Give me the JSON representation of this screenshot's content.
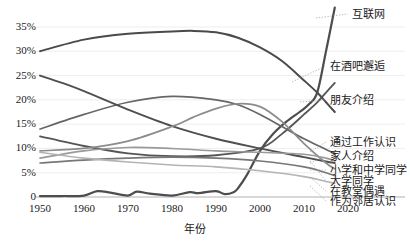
{
  "chart_data": {
    "type": "line",
    "title": "",
    "xlabel": "年份",
    "ylabel": "",
    "xlim": [
      1950,
      2020
    ],
    "ylim": [
      0,
      0.37
    ],
    "grid": true,
    "legend_position": "right-inline",
    "x_ticks": [
      "1950",
      "1960",
      "1970",
      "1980",
      "1990",
      "2000",
      "2010",
      "2020"
    ],
    "x_tick_values": [
      1950,
      1960,
      1970,
      1980,
      1990,
      2000,
      2010,
      2020
    ],
    "y_ticks": [
      "0",
      "5%",
      "10%",
      "15%",
      "20%",
      "25%",
      "30%",
      "35%"
    ],
    "y_tick_values": [
      0,
      5,
      10,
      15,
      20,
      25,
      30,
      35
    ],
    "series": [
      {
        "name": "互联网",
        "color": "#4d4d4d",
        "width": 2.2,
        "label_x": 352,
        "label_y": 14,
        "x": [
          1950,
          1955,
          1960,
          1963,
          1966,
          1970,
          1972,
          1975,
          1980,
          1984,
          1986,
          1990,
          1992,
          1994,
          1995,
          1997,
          2000,
          2003,
          2006,
          2009,
          2011,
          2013,
          2015,
          2017
        ],
        "values": [
          0.2,
          0.2,
          0.3,
          1.2,
          0.9,
          0.3,
          1.1,
          0.7,
          0.3,
          1.0,
          0.8,
          1.2,
          0.6,
          1.0,
          1.8,
          4.5,
          9.5,
          13.0,
          15.5,
          17.5,
          19.0,
          21.5,
          30.0,
          39.0
        ]
      },
      {
        "name": "在酒吧邂逅",
        "color": "#555555",
        "width": 1.8,
        "label_x": 330,
        "label_y": 66,
        "x": [
          1950,
          1960,
          1970,
          1980,
          1990,
          2000,
          2005,
          2010,
          2013,
          2015,
          2017
        ],
        "values": [
          12.5,
          10.5,
          9.0,
          8.4,
          8.6,
          10.0,
          13.0,
          17.0,
          19.5,
          21.5,
          23.5
        ]
      },
      {
        "name": "朋友介绍",
        "color": "#4a4a4a",
        "width": 2.0,
        "label_x": 330,
        "label_y": 100,
        "x": [
          1950,
          1960,
          1970,
          1980,
          1985,
          1990,
          1995,
          2000,
          2005,
          2010,
          2013,
          2015,
          2017
        ],
        "values": [
          30.0,
          32.4,
          33.6,
          34.1,
          34.2,
          33.9,
          32.8,
          30.8,
          28.0,
          24.0,
          21.5,
          19.5,
          17.5
        ]
      },
      {
        "name": "通过工作认识",
        "color": "#666666",
        "width": 1.7,
        "label_x": 330,
        "label_y": 142,
        "x": [
          1950,
          1960,
          1970,
          1980,
          1990,
          1995,
          2000,
          2005,
          2010,
          2015,
          2017
        ],
        "values": [
          14.0,
          17.0,
          19.5,
          20.7,
          20.0,
          19.0,
          17.0,
          14.5,
          12.0,
          9.8,
          9.0
        ]
      },
      {
        "name": "家人介绍",
        "color": "#4f4f4f",
        "width": 1.9,
        "label_x": 330,
        "label_y": 156,
        "x": [
          1950,
          1955,
          1960,
          1970,
          1980,
          1990,
          2000,
          2010,
          2015,
          2017
        ],
        "values": [
          25.0,
          23.5,
          21.8,
          18.0,
          14.6,
          12.0,
          10.0,
          8.2,
          7.3,
          7.0
        ]
      },
      {
        "name": "小学和中学同学",
        "color": "#8c8c8c",
        "width": 1.7,
        "label_x": 330,
        "label_y": 170,
        "x": [
          1950,
          1960,
          1970,
          1980,
          1985,
          1990,
          1995,
          2000,
          2005,
          2010,
          2015,
          2017
        ],
        "values": [
          9.5,
          10.0,
          11.5,
          14.5,
          16.5,
          18.2,
          19.2,
          18.6,
          15.5,
          11.0,
          7.0,
          5.8
        ]
      },
      {
        "name": "大学同学",
        "color": "#9a9a9a",
        "width": 1.6,
        "label_x": 330,
        "label_y": 181,
        "x": [
          1950,
          1960,
          1970,
          1980,
          1990,
          2000,
          2010,
          2015,
          2017
        ],
        "values": [
          8.0,
          9.5,
          10.2,
          10.0,
          9.5,
          9.2,
          8.8,
          8.0,
          7.4
        ]
      },
      {
        "name": "在教堂偶遇",
        "color": "#777777",
        "width": 1.6,
        "label_x": 330,
        "label_y": 191,
        "x": [
          1950,
          1960,
          1970,
          1980,
          1990,
          2000,
          2010,
          2015,
          2017
        ],
        "values": [
          7.0,
          7.6,
          8.0,
          8.2,
          8.0,
          7.4,
          6.2,
          5.0,
          4.4
        ]
      },
      {
        "name": "作为邻居认识",
        "color": "#b4b4b4",
        "width": 1.6,
        "label_x": 330,
        "label_y": 201,
        "x": [
          1950,
          1960,
          1970,
          1980,
          1990,
          2000,
          2010,
          2015,
          2017
        ],
        "values": [
          9.2,
          8.0,
          7.2,
          6.6,
          6.2,
          5.4,
          4.2,
          3.2,
          2.8
        ]
      }
    ],
    "leader_lines": [
      {
        "name": "互联网",
        "x1": 316,
        "y1": 18,
        "x2": 348,
        "y2": 14
      },
      {
        "name": "在酒吧邂逅",
        "x1": 292,
        "y1": 82,
        "x2": 326,
        "y2": 66
      },
      {
        "name": "朋友介绍",
        "x1": 300,
        "y1": 102,
        "x2": 326,
        "y2": 100
      },
      {
        "name": "通过工作认识",
        "x1": 310,
        "y1": 152,
        "x2": 326,
        "y2": 142
      },
      {
        "name": "家人介绍",
        "x1": 310,
        "y1": 163,
        "x2": 326,
        "y2": 156
      },
      {
        "name": "小学和中学同学",
        "x1": 310,
        "y1": 170,
        "x2": 326,
        "y2": 170
      },
      {
        "name": "大学同学",
        "x1": 310,
        "y1": 161,
        "x2": 326,
        "y2": 181
      },
      {
        "name": "在教堂偶遇",
        "x1": 310,
        "y1": 177,
        "x2": 326,
        "y2": 191
      },
      {
        "name": "作为邻居认识",
        "x1": 310,
        "y1": 186,
        "x2": 326,
        "y2": 201
      }
    ]
  },
  "axes": {
    "plot_left": 40,
    "plot_right": 348,
    "plot_top": 14,
    "plot_bottom": 197,
    "y_zero_px": 197,
    "y_per_pct_px": 4.857,
    "grid_color": "#e8e8e8",
    "axis_color": "#b0b0b0"
  }
}
